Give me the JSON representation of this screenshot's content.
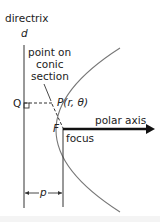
{
  "labels": {
    "directrix": "directrix",
    "d": "d",
    "point_on_line1": "point on",
    "point_on_line2": "conic",
    "point_on_line3": "section",
    "Q": "Q",
    "P": "P(r, θ)",
    "F": "F",
    "focus": "focus",
    "polar_axis": "polar axis",
    "p": "p"
  },
  "colors": {
    "line": "#333333",
    "curve": "#666666",
    "axis": "#111111",
    "text": "#222222"
  }
}
